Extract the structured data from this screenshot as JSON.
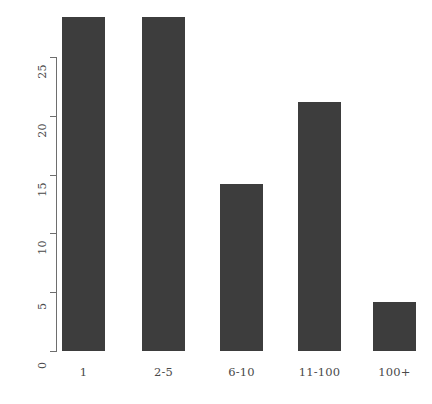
{
  "chart_data": {
    "type": "bar",
    "title": "",
    "subtitle": "",
    "xlabel": "",
    "ylabel": "",
    "categories": [
      "1",
      "2-5",
      "6-10",
      "11-100",
      "100+"
    ],
    "values": [
      28.4,
      28.4,
      14.2,
      21.2,
      4.2
    ],
    "ylim": [
      0,
      28.4
    ],
    "yticks": [
      0,
      5,
      10,
      15,
      20,
      25
    ],
    "ytick_labels": [
      "0",
      "5",
      "10",
      "15",
      "20",
      "25"
    ],
    "grid": false,
    "legend": null,
    "bar_color": "#3d3d3d",
    "axis_color": "#6e6e6e",
    "background": "#ffffff"
  },
  "axes": {
    "y": {
      "ticks": [
        {
          "label": "0",
          "value": 0
        },
        {
          "label": "5",
          "value": 5
        },
        {
          "label": "10",
          "value": 10
        },
        {
          "label": "15",
          "value": 15
        },
        {
          "label": "20",
          "value": 20
        },
        {
          "label": "25",
          "value": 25
        }
      ]
    },
    "x": {
      "ticks": [
        {
          "label": "1"
        },
        {
          "label": "2-5"
        },
        {
          "label": "6-10"
        },
        {
          "label": "11-100"
        },
        {
          "label": "100+"
        }
      ]
    }
  }
}
